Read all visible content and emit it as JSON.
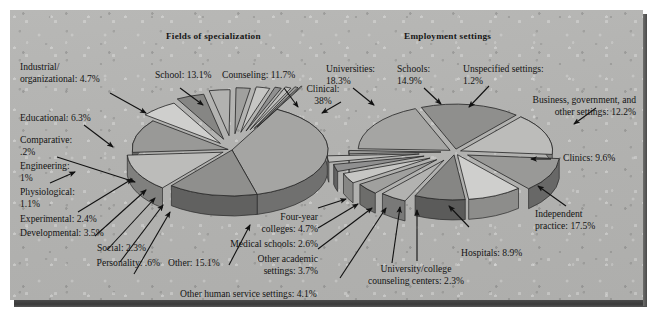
{
  "figure": {
    "background_color": "#b3b3b1",
    "base_shadow_color": "#3f3f3f"
  },
  "charts": [
    {
      "id": "fields-of-specialization",
      "title": "Fields of specialization",
      "labels": {
        "industrial": "Industrial/\norganizational:  4.7%",
        "school": "School:  13.1%",
        "counseling": "Counseling:  11.7%",
        "clinical": "Clinical:\n38%",
        "educational": "Educational:  6.3%",
        "comparative": "Comparative:\n.2%",
        "engineering": "Engineering:\n1%",
        "physiological": "Physiological:\n1.1%",
        "experimental": "Experimental:  2.4%",
        "developmental": "Developmental:  3.5%",
        "social": "Social:  2.3%",
        "personality": "Personality:  .6%",
        "other": "Other:  15.1%"
      }
    },
    {
      "id": "employment-settings",
      "title": "Employment settings",
      "labels": {
        "universities": "Universities:\n18.3%",
        "schools": "Schools:\n14.9%",
        "unspecified": "Unspecified settings:\n1.2%",
        "business": "Business, government, and\nother settings:  12.2%",
        "clinics": "Clinics:  9.6%",
        "independent": "Independent\npractice:  17.5%",
        "hospitals": "Hospitals:  8.9%",
        "counseling_centers": "University/college\ncounseling centers:  2.3%",
        "other_human_service": "Other human service settings:  4.1%",
        "other_academic": "Other academic\nsettings:  3.7%",
        "medical_schools": "Medical schools:  2.6%",
        "four_year": "Four-year\ncolleges:  4.7%"
      }
    }
  ],
  "chart_data": [
    {
      "type": "pie",
      "title": "Fields of specialization",
      "unit": "percent",
      "legend": "none",
      "categories": [
        "Clinical",
        "Other",
        "School",
        "Counseling",
        "Educational",
        "Industrial/organizational",
        "Developmental",
        "Experimental",
        "Social",
        "Physiological",
        "Engineering",
        "Personality",
        "Comparative"
      ],
      "values": [
        38,
        15.1,
        13.1,
        11.7,
        6.3,
        4.7,
        3.5,
        2.4,
        2.3,
        1.1,
        1,
        0.6,
        0.2
      ],
      "labels": [
        "Clinical: 38%",
        "Other: 15.1%",
        "School: 13.1%",
        "Counseling: 11.7%",
        "Educational: 6.3%",
        "Industrial/organizational: 4.7%",
        "Developmental: 3.5%",
        "Experimental: 2.4%",
        "Social: 2.3%",
        "Physiological: 1.1%",
        "Engineering: 1%",
        "Personality: .6%",
        "Comparative: .2%"
      ]
    },
    {
      "type": "pie",
      "title": "Employment settings",
      "unit": "percent",
      "legend": "none",
      "categories": [
        "Universities",
        "Independent practice",
        "Schools",
        "Business, government, and other settings",
        "Clinics",
        "Hospitals",
        "Four-year colleges",
        "Other human service settings",
        "Other academic settings",
        "Medical schools",
        "University/college counseling centers",
        "Unspecified settings"
      ],
      "values": [
        18.3,
        17.5,
        14.9,
        12.2,
        9.6,
        8.9,
        4.7,
        4.1,
        3.7,
        2.6,
        2.3,
        1.2
      ],
      "labels": [
        "Universities: 18.3%",
        "Independent practice: 17.5%",
        "Schools: 14.9%",
        "Business, government, and other settings: 12.2%",
        "Clinics: 9.6%",
        "Hospitals: 8.9%",
        "Four-year colleges: 4.7%",
        "Other human service settings: 4.1%",
        "Other academic settings: 3.7%",
        "Medical schools: 2.6%",
        "University/college counseling centers: 2.3%",
        "Unspecified settings: 1.2%"
      ]
    }
  ]
}
